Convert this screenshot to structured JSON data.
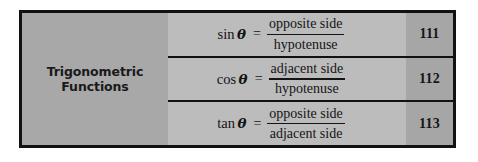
{
  "table": {
    "label": {
      "line1": "Trigonometric",
      "line2": "Functions"
    },
    "rows": [
      {
        "function": "sin",
        "variable": "θ",
        "equals": "=",
        "numerator": "opposite side",
        "denominator": "hypotenuse",
        "page": "111"
      },
      {
        "function": "cos",
        "variable": "θ",
        "equals": "=",
        "numerator": "adjacent side",
        "denominator": "hypotenuse",
        "page": "112"
      },
      {
        "function": "tan",
        "variable": "θ",
        "equals": "=",
        "numerator": "opposite side",
        "denominator": "adjacent side",
        "page": "113"
      }
    ],
    "colors": {
      "frame": "#111111",
      "label_panel": "#a8a8a8",
      "formula_panel": "#bcbcbc",
      "number_panel": "#a6a6a6",
      "text": "#141414",
      "page_background": "#ffffff"
    }
  }
}
